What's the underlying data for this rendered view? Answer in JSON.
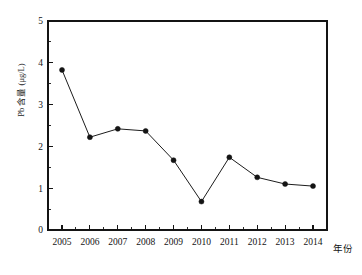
{
  "chart_data": {
    "type": "line",
    "title": "",
    "subtitle": "",
    "xlabel": "年份",
    "ylabel": "Pb 含量 (μg/L)",
    "categories": [
      "2005",
      "2006",
      "2007",
      "2008",
      "2009",
      "2010",
      "2011",
      "2012",
      "2013",
      "2014"
    ],
    "x": [
      2005,
      2006,
      2007,
      2008,
      2009,
      2010,
      2011,
      2012,
      2013,
      2014
    ],
    "values": [
      3.83,
      2.22,
      2.42,
      2.37,
      1.67,
      0.68,
      1.74,
      1.26,
      1.1,
      1.05
    ],
    "series": [
      {
        "name": "Pb 含量",
        "values": [
          3.83,
          2.22,
          2.42,
          2.37,
          1.67,
          0.68,
          1.74,
          1.26,
          1.1,
          1.05
        ]
      }
    ],
    "ylim": [
      0,
      5
    ],
    "ytick_labels": [
      "0",
      "1",
      "2",
      "3",
      "4",
      "5"
    ],
    "ytick_values": [
      0,
      1,
      2,
      3,
      4,
      5
    ],
    "y_minor_ticks_per_interval": 1,
    "x_minor_ticks_per_interval": 1,
    "grid": false,
    "legend": false,
    "legend_position": "none",
    "marker": "filled-circle",
    "marker_color": "#141414",
    "line_color": "#1c1c1c",
    "background_color": "#ffffff",
    "frame": "box",
    "tick_direction": "out"
  },
  "axes": {
    "y_title": "Pb 含量 (μg/L)",
    "x_title": "年份",
    "y_ticks": [
      "0",
      "1",
      "2",
      "3",
      "4",
      "5"
    ],
    "x_ticks": [
      "2005",
      "2006",
      "2007",
      "2008",
      "2009",
      "2010",
      "2011",
      "2012",
      "2013",
      "2014"
    ]
  }
}
